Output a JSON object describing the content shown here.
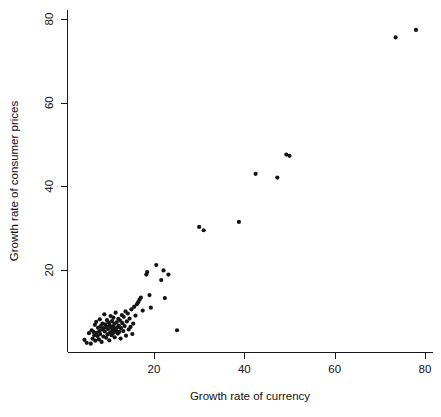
{
  "chart_data": {
    "type": "scatter",
    "title": "",
    "xlabel": "Growth rate of currency",
    "ylabel": "Growth rate of consumer prices",
    "xlim": [
      3.0,
      81.0
    ],
    "ylim": [
      1.5,
      79.5
    ],
    "xticks": [
      20,
      40,
      60,
      80
    ],
    "yticks": [
      20,
      40,
      60,
      80
    ],
    "grid": false,
    "legend": null,
    "point_style": {
      "marker": "filled-circle",
      "color": "#141414",
      "radius": 2.1
    },
    "n_points": 91,
    "points": [
      [
        4.6,
        3.3
      ],
      [
        5.1,
        2.6
      ],
      [
        5.6,
        4.9
      ],
      [
        6.0,
        2.4
      ],
      [
        6.2,
        5.6
      ],
      [
        6.4,
        3.6
      ],
      [
        6.6,
        5.2
      ],
      [
        6.8,
        4.4
      ],
      [
        6.9,
        6.9
      ],
      [
        7.0,
        3.1
      ],
      [
        7.2,
        7.6
      ],
      [
        7.3,
        5.0
      ],
      [
        7.5,
        4.2
      ],
      [
        7.6,
        6.2
      ],
      [
        7.8,
        3.4
      ],
      [
        7.9,
        5.4
      ],
      [
        8.0,
        8.2
      ],
      [
        8.1,
        4.7
      ],
      [
        8.2,
        6.6
      ],
      [
        8.4,
        2.8
      ],
      [
        8.5,
        5.8
      ],
      [
        8.6,
        7.2
      ],
      [
        8.8,
        4.1
      ],
      [
        8.9,
        6.1
      ],
      [
        9.0,
        9.4
      ],
      [
        9.1,
        5.3
      ],
      [
        9.2,
        7.0
      ],
      [
        9.4,
        3.8
      ],
      [
        9.5,
        6.4
      ],
      [
        9.6,
        8.0
      ],
      [
        9.7,
        4.6
      ],
      [
        9.8,
        5.9
      ],
      [
        10.0,
        7.4
      ],
      [
        10.1,
        3.2
      ],
      [
        10.2,
        6.8
      ],
      [
        10.3,
        5.1
      ],
      [
        10.4,
        9.0
      ],
      [
        10.5,
        6.2
      ],
      [
        10.6,
        4.4
      ],
      [
        10.7,
        7.8
      ],
      [
        10.8,
        5.6
      ],
      [
        10.9,
        6.5
      ],
      [
        11.0,
        8.6
      ],
      [
        11.1,
        5.0
      ],
      [
        11.2,
        7.1
      ],
      [
        11.3,
        3.9
      ],
      [
        11.4,
        6.0
      ],
      [
        11.5,
        9.8
      ],
      [
        11.6,
        5.5
      ],
      [
        11.7,
        7.5
      ],
      [
        11.9,
        6.3
      ],
      [
        12.0,
        4.8
      ],
      [
        12.1,
        8.3
      ],
      [
        12.2,
        6.7
      ],
      [
        12.3,
        5.2
      ],
      [
        12.5,
        7.9
      ],
      [
        12.6,
        3.6
      ],
      [
        12.7,
        6.1
      ],
      [
        12.9,
        9.2
      ],
      [
        13.0,
        7.3
      ],
      [
        13.2,
        5.4
      ],
      [
        13.3,
        8.8
      ],
      [
        13.5,
        6.6
      ],
      [
        13.7,
        10.1
      ],
      [
        13.8,
        4.3
      ],
      [
        14.0,
        7.7
      ],
      [
        14.2,
        9.6
      ],
      [
        14.4,
        5.8
      ],
      [
        14.6,
        8.4
      ],
      [
        14.8,
        6.4
      ],
      [
        15.0,
        10.6
      ],
      [
        15.2,
        4.7
      ],
      [
        15.4,
        7.2
      ],
      [
        15.6,
        11.2
      ],
      [
        15.9,
        9.1
      ],
      [
        16.2,
        11.8
      ],
      [
        16.5,
        12.3
      ],
      [
        16.8,
        12.9
      ],
      [
        17.1,
        13.4
      ],
      [
        17.5,
        10.3
      ],
      [
        18.3,
        18.9
      ],
      [
        18.5,
        19.5
      ],
      [
        19.0,
        14.0
      ],
      [
        19.3,
        11.0
      ],
      [
        20.5,
        21.2
      ],
      [
        21.6,
        17.6
      ],
      [
        22.1,
        19.9
      ],
      [
        22.4,
        13.3
      ],
      [
        23.2,
        18.9
      ],
      [
        25.1,
        5.6
      ],
      [
        30.0,
        30.3
      ],
      [
        31.0,
        29.5
      ],
      [
        38.8,
        31.5
      ],
      [
        42.5,
        43.0
      ],
      [
        47.3,
        42.1
      ],
      [
        49.3,
        47.6
      ],
      [
        50.0,
        47.3
      ],
      [
        73.5,
        75.6
      ],
      [
        78.0,
        77.4
      ]
    ]
  },
  "axes": {
    "x_tick_labels": [
      "20",
      "40",
      "60",
      "80"
    ],
    "y_tick_labels": [
      "20",
      "40",
      "60",
      "80"
    ]
  }
}
